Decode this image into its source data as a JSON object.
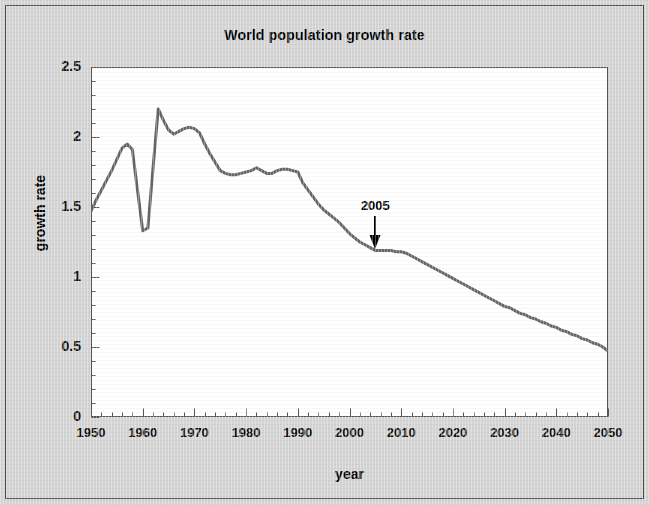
{
  "figure": {
    "background_color": "#d4d4d4",
    "plot_background_color": "#ffffff",
    "frame_color": "#4a4a4a"
  },
  "title": "World population growth rate",
  "axis": {
    "x_label": "year",
    "y_label": "growth rate",
    "x_ticks": [
      "1950",
      "1960",
      "1970",
      "1980",
      "1990",
      "2000",
      "2010",
      "2020",
      "2030",
      "2040",
      "2050"
    ],
    "y_ticks": [
      "0",
      "0.5",
      "1",
      "1.5",
      "2",
      "2.5"
    ]
  },
  "annotations": [
    {
      "label": "2005",
      "x": 2005,
      "y": 1.19,
      "icon": "down-arrow-icon"
    }
  ],
  "chart_data": {
    "type": "line",
    "title": "World population growth rate",
    "xlabel": "year",
    "ylabel": "growth rate",
    "xlim": [
      1950,
      2050
    ],
    "ylim": [
      0,
      2.5
    ],
    "xticks": [
      1950,
      1960,
      1970,
      1980,
      1990,
      2000,
      2010,
      2020,
      2030,
      2040,
      2050
    ],
    "yticks": [
      0,
      0.5,
      1,
      1.5,
      2,
      2.5
    ],
    "x_minor_tick_interval": 2,
    "y_minor_tick_interval": 0.1,
    "grid": false,
    "legend": null,
    "series": [
      {
        "name": "World population growth rate",
        "color": "#666666",
        "line_width": 3,
        "units": "percent per year",
        "x": [
          1950,
          1951,
          1952,
          1953,
          1954,
          1955,
          1956,
          1957,
          1958,
          1959,
          1960,
          1961,
          1962,
          1963,
          1964,
          1965,
          1966,
          1967,
          1968,
          1969,
          1970,
          1971,
          1972,
          1973,
          1974,
          1975,
          1976,
          1977,
          1978,
          1979,
          1980,
          1981,
          1982,
          1983,
          1984,
          1985,
          1986,
          1987,
          1988,
          1989,
          1990,
          1991,
          1992,
          1993,
          1994,
          1995,
          1996,
          1997,
          1998,
          1999,
          2000,
          2001,
          2002,
          2003,
          2004,
          2005,
          2006,
          2007,
          2008,
          2009,
          2010,
          2011,
          2012,
          2013,
          2014,
          2015,
          2016,
          2017,
          2018,
          2019,
          2020,
          2021,
          2022,
          2023,
          2024,
          2025,
          2026,
          2027,
          2028,
          2029,
          2030,
          2031,
          2032,
          2033,
          2034,
          2035,
          2036,
          2037,
          2038,
          2039,
          2040,
          2041,
          2042,
          2043,
          2044,
          2045,
          2046,
          2047,
          2048,
          2049,
          2050
        ],
        "y": [
          1.47,
          1.55,
          1.62,
          1.69,
          1.76,
          1.84,
          1.92,
          1.95,
          1.91,
          1.62,
          1.33,
          1.35,
          1.78,
          2.2,
          2.12,
          2.05,
          2.02,
          2.04,
          2.06,
          2.07,
          2.06,
          2.03,
          1.95,
          1.88,
          1.82,
          1.76,
          1.74,
          1.73,
          1.73,
          1.74,
          1.75,
          1.76,
          1.78,
          1.76,
          1.74,
          1.74,
          1.76,
          1.77,
          1.77,
          1.76,
          1.75,
          1.67,
          1.62,
          1.57,
          1.52,
          1.48,
          1.45,
          1.42,
          1.39,
          1.35,
          1.31,
          1.28,
          1.25,
          1.23,
          1.21,
          1.19,
          1.19,
          1.19,
          1.19,
          1.18,
          1.18,
          1.17,
          1.15,
          1.13,
          1.11,
          1.09,
          1.07,
          1.05,
          1.03,
          1.01,
          0.99,
          0.97,
          0.95,
          0.93,
          0.91,
          0.89,
          0.87,
          0.85,
          0.83,
          0.81,
          0.79,
          0.78,
          0.76,
          0.74,
          0.73,
          0.71,
          0.7,
          0.68,
          0.67,
          0.65,
          0.64,
          0.62,
          0.61,
          0.59,
          0.58,
          0.56,
          0.55,
          0.53,
          0.52,
          0.5,
          0.47
        ]
      }
    ],
    "annotations": [
      {
        "text": "2005",
        "x": 2005,
        "y": 1.19,
        "arrow": "down"
      }
    ]
  }
}
